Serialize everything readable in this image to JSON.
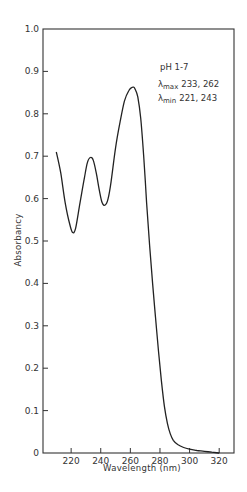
{
  "chart_data": {
    "type": "line",
    "title": "",
    "xlabel": "Wavelength (nm)",
    "ylabel": "Absorbancy",
    "xlim": [
      201,
      330
    ],
    "ylim": [
      0,
      1.0
    ],
    "grid": false,
    "legend": null,
    "x_ticks": [
      220,
      240,
      260,
      280,
      300,
      320
    ],
    "y_ticks": [
      0,
      0.1,
      0.2,
      0.3,
      0.4,
      0.5,
      0.6,
      0.7,
      0.8,
      0.9,
      1.0
    ],
    "y_tick_labels": [
      "0",
      "0.1",
      "0.2",
      "0.3",
      "0.4",
      "0.5",
      "0.6",
      "0.7",
      "0.8",
      "0.9",
      "1.0"
    ],
    "annotations": {
      "condition": "pH 1-7",
      "lambda_max_label": "λ",
      "lambda_max_sub": "max",
      "lambda_max_values": "233, 262",
      "lambda_min_label": "λ",
      "lambda_min_sub": "min",
      "lambda_min_values": "221, 243"
    },
    "series": [
      {
        "name": "pH 1-7",
        "x": [
          210,
          213,
          216,
          219,
          221,
          223,
          226,
          229,
          231,
          233,
          235,
          237,
          239,
          241,
          243,
          245,
          247,
          250,
          253,
          256,
          259,
          261,
          262,
          263,
          265,
          267,
          269,
          271,
          273,
          275,
          277,
          279,
          281,
          283,
          285,
          287,
          289,
          292,
          296,
          300,
          305,
          310,
          315,
          320
        ],
        "y": [
          0.71,
          0.66,
          0.59,
          0.54,
          0.52,
          0.53,
          0.59,
          0.65,
          0.685,
          0.697,
          0.69,
          0.66,
          0.62,
          0.59,
          0.585,
          0.6,
          0.64,
          0.72,
          0.78,
          0.83,
          0.855,
          0.862,
          0.863,
          0.86,
          0.84,
          0.79,
          0.7,
          0.59,
          0.49,
          0.4,
          0.32,
          0.24,
          0.17,
          0.11,
          0.07,
          0.045,
          0.03,
          0.02,
          0.013,
          0.009,
          0.006,
          0.004,
          0.002,
          0.0
        ]
      }
    ]
  }
}
